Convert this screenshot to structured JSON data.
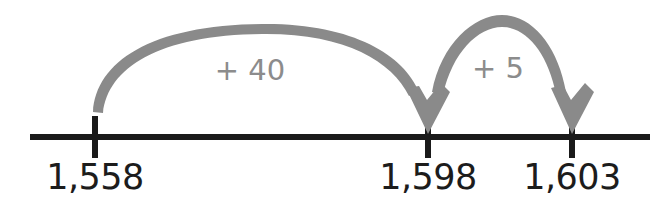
{
  "figure": {
    "type": "number-line-diagram",
    "background_color": "#ffffff",
    "line_color": "#1a1a1a",
    "arc_color": "#8a8a8a",
    "label_color": "#1c1c1c",
    "jump_label_color": "#8c8c8c"
  },
  "number_line": {
    "start_x": 30,
    "end_x": 650,
    "y": 137,
    "ticks": [
      {
        "label": "1,558",
        "value": 1558,
        "x": 95
      },
      {
        "label": "1,598",
        "value": 1598,
        "x": 428
      },
      {
        "label": "1,603",
        "value": 1603,
        "x": 572
      }
    ]
  },
  "jumps": [
    {
      "label": "+ 40",
      "amount": 40,
      "from_value": 1558,
      "to_value": 1598,
      "from_x": 95,
      "to_x": 428,
      "apex_y": 24,
      "label_x": 250,
      "label_y": 70
    },
    {
      "label": "+ 5",
      "amount": 5,
      "from_value": 1598,
      "to_value": 1603,
      "from_x": 428,
      "to_x": 572,
      "apex_y": 15,
      "label_x": 498,
      "label_y": 68
    }
  ],
  "chart_data": {
    "type": "line",
    "title": "",
    "xlabel": "",
    "ylabel": "",
    "categories": [
      "1,558",
      "1,598",
      "1,603"
    ],
    "values": [
      1558,
      1598,
      1603
    ],
    "annotations": [
      "+ 40",
      "+ 5"
    ],
    "xlim": [
      1558,
      1603
    ],
    "grid": false,
    "legend": "none"
  }
}
